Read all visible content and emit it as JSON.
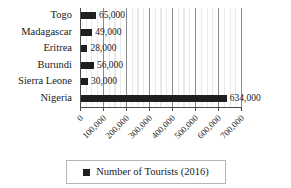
{
  "chart_data": {
    "type": "bar",
    "orientation": "horizontal",
    "title": "",
    "xlabel": "",
    "ylabel": "",
    "categories": [
      "Togo",
      "Madagascar",
      "Eritrea",
      "Burundi",
      "Sierra Leone",
      "Nigeria"
    ],
    "values": [
      65000,
      49000,
      28000,
      56000,
      30000,
      634000
    ],
    "data_labels": [
      "65,000",
      "49,000",
      "28,000",
      "56,000",
      "30,000",
      "634,000"
    ],
    "series": [
      {
        "name": "Number of Tourists  (2016)",
        "values": [
          65000,
          49000,
          28000,
          56000,
          30000,
          634000
        ]
      }
    ],
    "xlim": [
      0,
      700000
    ],
    "xticks": [
      0,
      100000,
      200000,
      300000,
      400000,
      500000,
      600000,
      700000
    ],
    "xtick_labels": [
      "0",
      "100,000",
      "200,000",
      "300,000",
      "400,000",
      "500,000",
      "600,000",
      "700,000"
    ],
    "xtick_rotation": -45,
    "grid": true,
    "minor_grid_step": 25000,
    "major_grid_step": 100000,
    "legend": {
      "position": "bottom",
      "entries": [
        {
          "label": "Number of Tourists  (2016)",
          "color": "#1f1f1f",
          "marker": "square"
        }
      ]
    },
    "colors": {
      "bar": "#1f1f1f",
      "axis": "#4a4a4a",
      "major_gridline": "#8a8a8a",
      "minor_gridline": "#e9e9e9",
      "text": "#1a1a1a",
      "legend_border": "#b5b5b5",
      "background": "#ffffff"
    }
  }
}
